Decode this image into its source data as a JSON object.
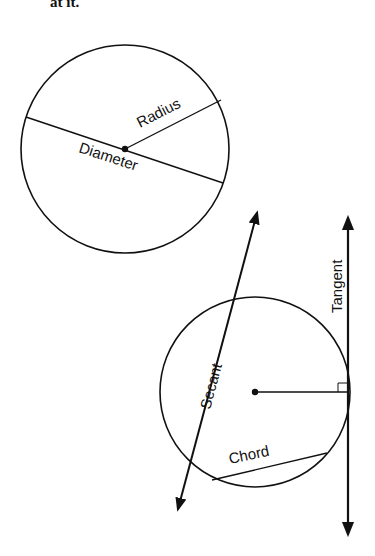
{
  "caption": "at it.",
  "diagram": {
    "circle1": {
      "center": [
        125,
        149
      ],
      "radius": 104,
      "labels": {
        "radius": "Radius",
        "diameter": "Diameter"
      }
    },
    "circle2": {
      "center": [
        255,
        392
      ],
      "radius": 95,
      "labels": {
        "secant": "Secant",
        "chord": "Chord",
        "tangent": "Tangent"
      }
    },
    "stroke_color": "#111111",
    "background": "#ffffff"
  }
}
